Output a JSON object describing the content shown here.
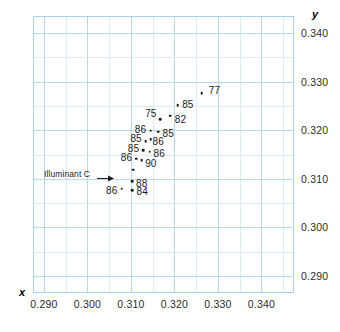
{
  "chart_data": {
    "type": "scatter",
    "title": "",
    "subtitle": "",
    "xlabel": "x",
    "ylabel": "y",
    "xlim": [
      0.2875,
      0.3475
    ],
    "ylim": [
      0.2865,
      0.3435
    ],
    "grid": true,
    "grid_major_step": 0.01,
    "grid_minor_step": 0.005,
    "legend": "none",
    "xticks": [
      "0.290",
      "0.300",
      "0.310",
      "0.320",
      "0.330",
      "0.340"
    ],
    "xtick_values": [
      0.29,
      0.3,
      0.31,
      0.32,
      0.33,
      0.34
    ],
    "yticks": [
      "0.290",
      "0.300",
      "0.310",
      "0.320",
      "0.330",
      "0.340"
    ],
    "ytick_values": [
      0.29,
      0.3,
      0.31,
      0.32,
      0.33,
      0.34
    ],
    "point_label_note": "each point is annotated with its CRI value",
    "points": [
      {
        "label": "77",
        "x": 0.3263,
        "y": 0.3276,
        "lx": 0.3292,
        "ly": 0.3283
      },
      {
        "label": "85",
        "x": 0.3208,
        "y": 0.3252,
        "lx": 0.3231,
        "ly": 0.3253
      },
      {
        "label": "82",
        "x": 0.319,
        "y": 0.323,
        "lx": 0.3214,
        "ly": 0.3224
      },
      {
        "label": "75",
        "x": 0.3168,
        "y": 0.3223,
        "lx": 0.3146,
        "ly": 0.3235
      },
      {
        "label": "85",
        "x": 0.3163,
        "y": 0.3197,
        "lx": 0.3186,
        "ly": 0.3194
      },
      {
        "label": "86",
        "x": 0.3146,
        "y": 0.3199,
        "lx": 0.3122,
        "ly": 0.3203
      },
      {
        "label": "86",
        "x": 0.3146,
        "y": 0.3181,
        "lx": 0.3163,
        "ly": 0.3178
      },
      {
        "label": "85",
        "x": 0.3134,
        "y": 0.3177,
        "lx": 0.3112,
        "ly": 0.3183
      },
      {
        "label": "86",
        "x": 0.3143,
        "y": 0.3156,
        "lx": 0.3165,
        "ly": 0.3153
      },
      {
        "label": "85",
        "x": 0.3128,
        "y": 0.3159,
        "lx": 0.3106,
        "ly": 0.3163
      },
      {
        "label": "90",
        "x": 0.3125,
        "y": 0.3138,
        "lx": 0.3146,
        "ly": 0.3133
      },
      {
        "label": "86",
        "x": 0.3112,
        "y": 0.3141,
        "lx": 0.309,
        "ly": 0.3144
      },
      {
        "label": "88",
        "x": 0.3103,
        "y": 0.3095,
        "lx": 0.3125,
        "ly": 0.3091
      },
      {
        "label": "84",
        "x": 0.3103,
        "y": 0.3077,
        "lx": 0.3126,
        "ly": 0.3074
      },
      {
        "label": "86",
        "x": 0.3079,
        "y": 0.308,
        "lx": 0.3056,
        "ly": 0.3077
      },
      {
        "label": "",
        "x": 0.3106,
        "y": 0.3119,
        "lx": null,
        "ly": null
      }
    ],
    "annotations": [
      {
        "name": "illuminant-c",
        "text": "Illuminant C",
        "arrow": "right-arrow",
        "points_to_x": 0.3106,
        "points_to_y": 0.3119
      }
    ]
  }
}
